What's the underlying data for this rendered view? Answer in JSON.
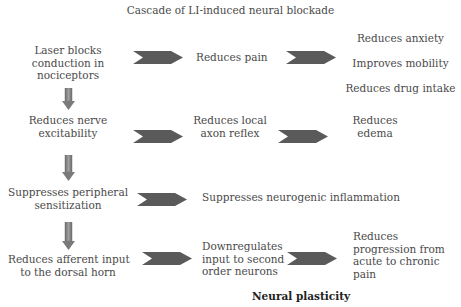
{
  "title": "Cascade of LI-induced neural blockade",
  "colors": {
    "chevron": "#5a5a5a",
    "down_arrow": "#8a8a8a",
    "text": "#4a4a4a"
  },
  "rows": [
    {
      "left": [
        "Laser blocks",
        "conduction in",
        "nociceptors"
      ],
      "middle": [
        "Reduces pain"
      ],
      "right_list": [
        "Reduces anxiety",
        "Improves mobility",
        "Reduces drug intake"
      ]
    },
    {
      "left": [
        "Reduces nerve",
        "excitability"
      ],
      "middle": [
        "Reduces local",
        "axon reflex"
      ],
      "right": [
        "Reduces",
        "edema"
      ]
    },
    {
      "left": [
        "Suppresses peripheral",
        "sensitization"
      ],
      "middle": [
        "Suppresses neurogenic inflammation"
      ]
    },
    {
      "left": [
        "Reduces afferent input",
        "to the dorsal horn"
      ],
      "middle": [
        "Downregulates",
        "input to second",
        "order neurons"
      ],
      "right": [
        "Reduces",
        "progression from",
        "acute to chronic",
        "pain"
      ]
    }
  ],
  "footer_label": "Neural plasticity",
  "icons": {
    "chevron": "chevron-right-arrow",
    "down": "down-arrow"
  }
}
